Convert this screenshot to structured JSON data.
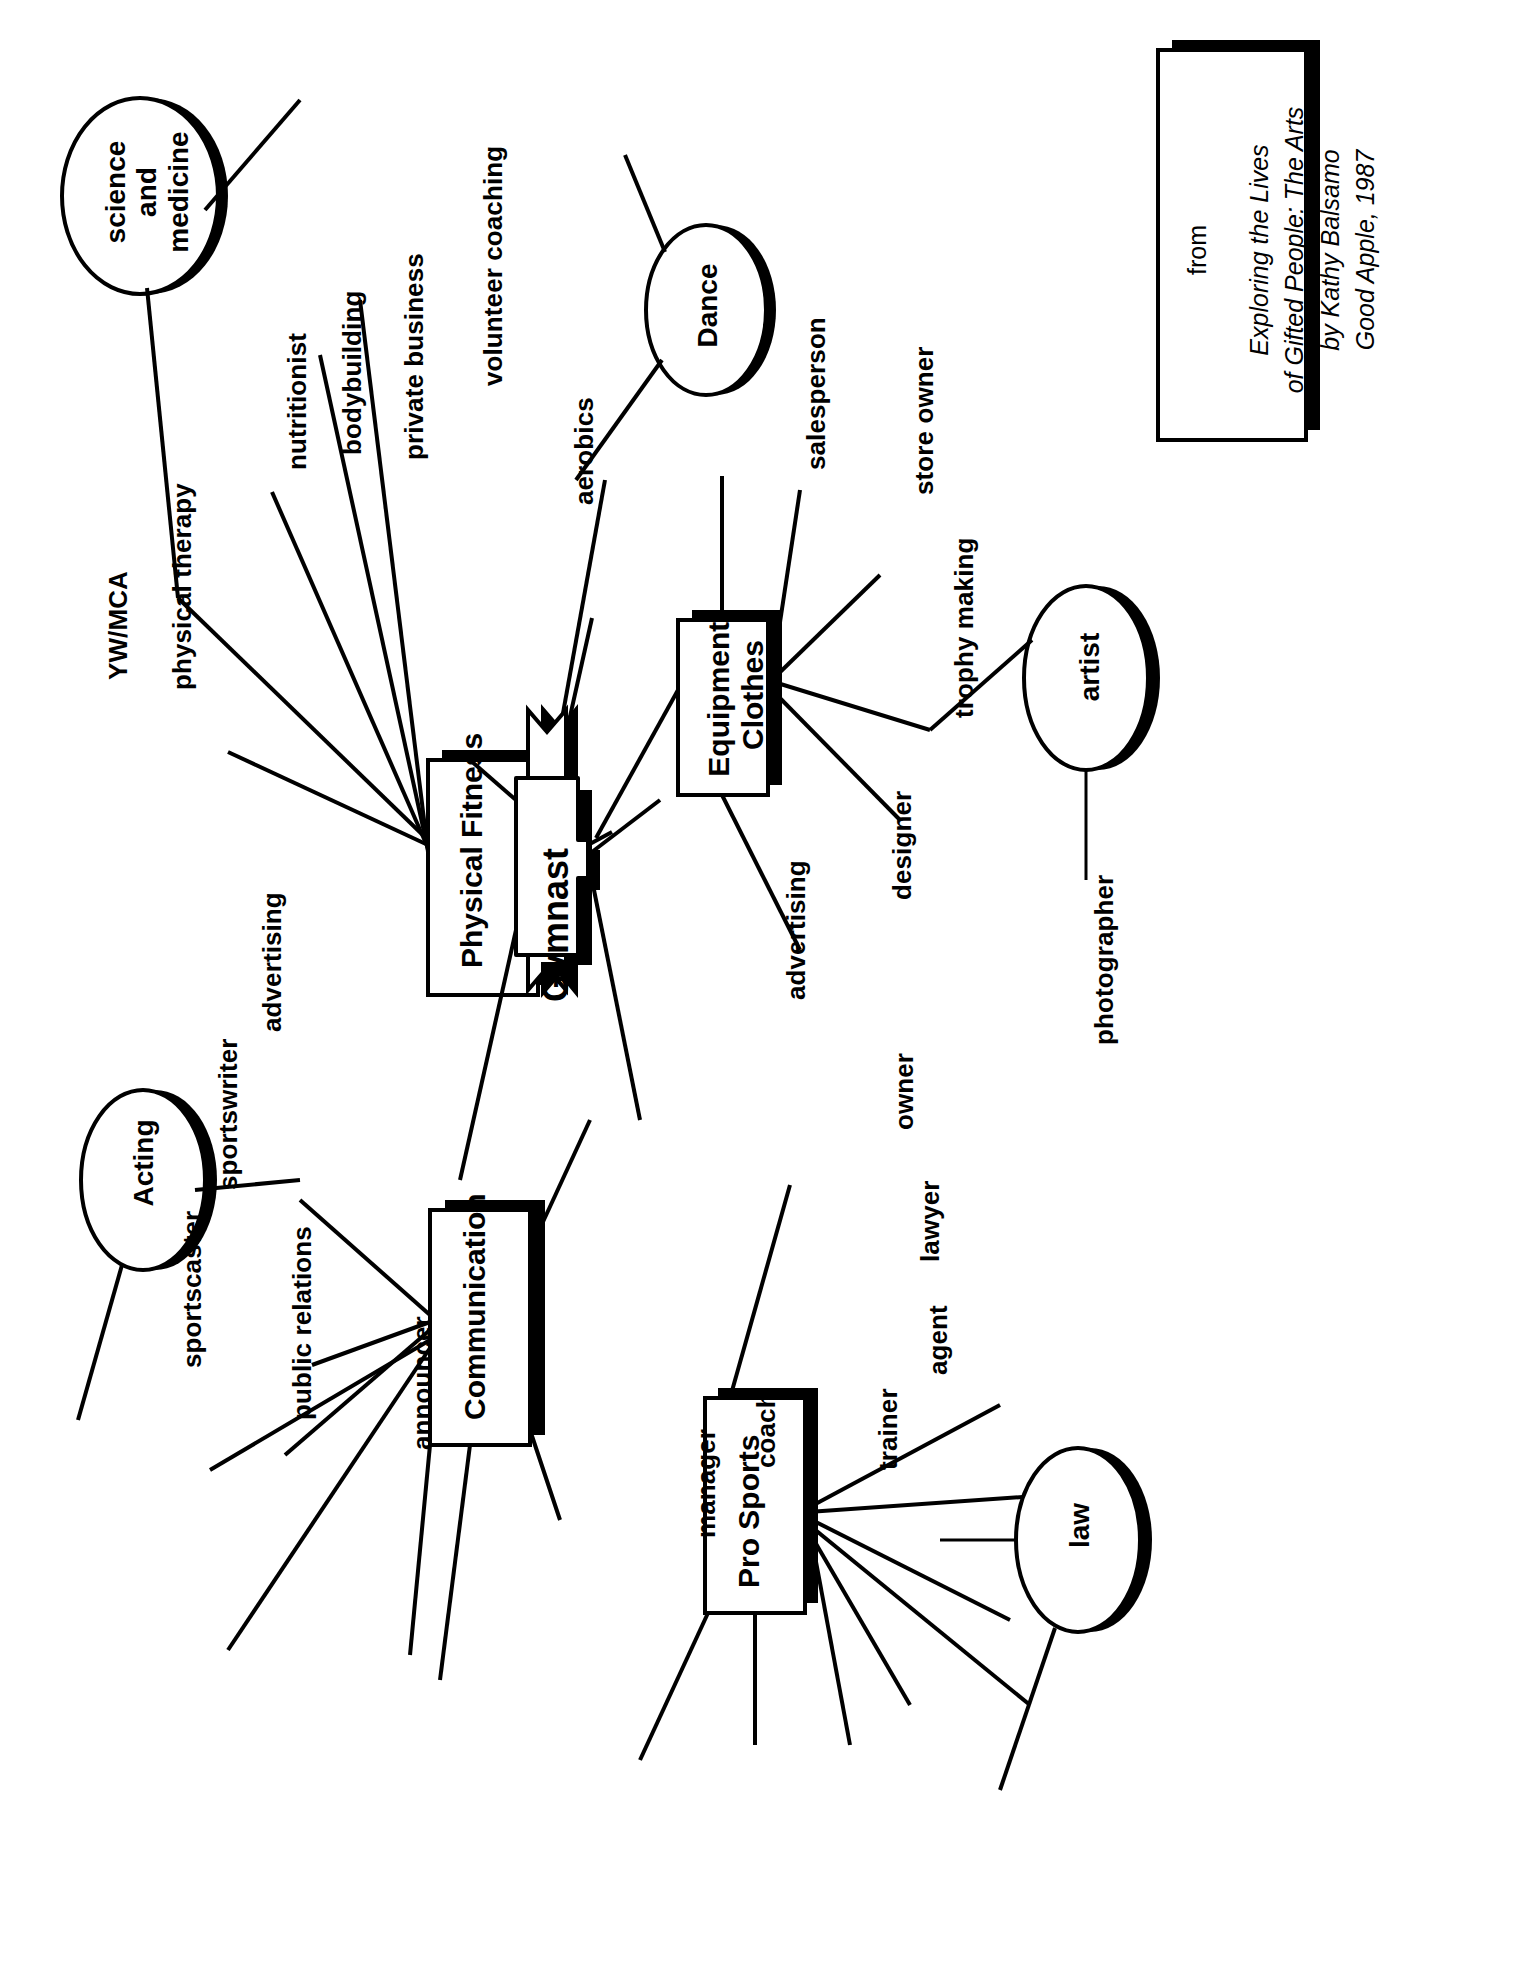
{
  "diagram": {
    "orientation": "rotated-90-ccw",
    "center": {
      "label": "Gymnast",
      "shape": "banner-ribbon"
    },
    "branches": [
      {
        "id": "physical-fitness",
        "label": "Physical Fitness",
        "shape": "box",
        "leaves": [
          "YW/MCA",
          "physical therapy",
          "nutritionist",
          "bodybuilding",
          "private business",
          "volunteer coaching",
          "aerobics"
        ]
      },
      {
        "id": "equipment-clothes",
        "label": "Equipment/ Clothes",
        "label_line1": "Equipment/",
        "label_line2": "Clothes",
        "shape": "box",
        "leaves": [
          "salesperson",
          "store owner",
          "trophy making",
          "designer",
          "advertising"
        ]
      },
      {
        "id": "communication",
        "label": "Communication",
        "shape": "box",
        "leaves": [
          "advertising",
          "sportswriter",
          "sportscaster",
          "public relations",
          "announcer"
        ]
      },
      {
        "id": "pro-sports",
        "label": "Pro Sports",
        "shape": "box",
        "leaves": [
          "owner",
          "lawyer",
          "agent",
          "trainer",
          "coach",
          "manager"
        ]
      }
    ],
    "ellipses": [
      {
        "id": "science-and-medicine",
        "line1": "science",
        "line2": "and",
        "line3": "medicine",
        "label": "science and medicine"
      },
      {
        "id": "dance",
        "label": "Dance"
      },
      {
        "id": "acting",
        "label": "Acting"
      },
      {
        "id": "artist",
        "label": "artist",
        "leaf": "photographer"
      },
      {
        "id": "law",
        "label": "law"
      }
    ]
  },
  "citation": {
    "from": "from",
    "line1": "Exploring the Lives",
    "line2": "of Gifted People: The Arts",
    "line3": "by Kathy Balsamo",
    "line4": "Good Apple, 1987"
  },
  "colors": {
    "ink": "#000000",
    "paper": "#ffffff",
    "shadow": "#000000"
  }
}
